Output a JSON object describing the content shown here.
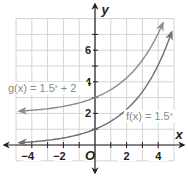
{
  "chart_data": {
    "type": "line",
    "title": "",
    "xlabel": "x",
    "ylabel": "y",
    "origin_label": "O",
    "xlim": [
      -5,
      5
    ],
    "ylim": [
      -1,
      8
    ],
    "grid": true,
    "grid_step": 1,
    "x_ticks": [
      -4,
      -2,
      2,
      4
    ],
    "x_tick_labels": [
      "−4",
      "−2",
      "2",
      "4"
    ],
    "y_ticks": [
      2,
      4,
      6
    ],
    "y_tick_labels": [
      "2",
      "4",
      "6"
    ],
    "series": [
      {
        "name": "g(x) = 1.5^x + 2",
        "label_text": "g(x) = 1.5",
        "label_exp": "x",
        "label_suffix": " + 2",
        "color": "#8c8c8c",
        "x": [
          -5,
          -4,
          -3,
          -2,
          -1,
          0,
          1,
          2,
          3,
          4,
          4.3
        ],
        "values": [
          2.13,
          2.2,
          2.3,
          2.44,
          2.67,
          3,
          3.5,
          4.25,
          5.38,
          7.06,
          7.7
        ],
        "arrows": "both"
      },
      {
        "name": "f(x) = 1.5^x",
        "label_text": "f(x) = 1.5",
        "label_exp": "x",
        "label_suffix": "",
        "color": "#6e6e6e",
        "x": [
          -5,
          -4,
          -3,
          -2,
          -1,
          0,
          1,
          2,
          3,
          4,
          5
        ],
        "values": [
          0.13,
          0.2,
          0.3,
          0.44,
          0.67,
          1,
          1.5,
          2.25,
          3.38,
          5.06,
          7.59
        ],
        "arrows": "both"
      }
    ],
    "legend": "inline labels"
  }
}
